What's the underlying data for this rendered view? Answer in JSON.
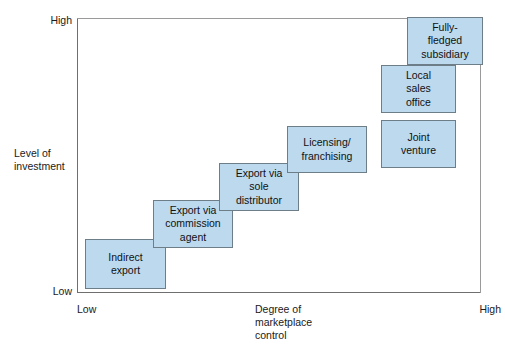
{
  "figure": {
    "width": 505,
    "height": 350,
    "background": "#ffffff",
    "box_fill": "#bcd9ee",
    "box_border": "#6e7e89",
    "axis_color": "#6f6f6f"
  },
  "axes": {
    "y": {
      "title": "Level of\ninvestment",
      "high_label": "High",
      "low_label": "Low"
    },
    "x": {
      "title": "Degree of\nmarketplace\ncontrol",
      "low_label": "Low",
      "high_label": "High"
    }
  },
  "chart_data": {
    "type": "diagram",
    "title": "",
    "xlabel": "Degree of marketplace control",
    "ylabel": "Level of investment",
    "xlim": [
      "Low",
      "High"
    ],
    "ylim": [
      "Low",
      "High"
    ],
    "grid": false,
    "legend": "none",
    "categories": [
      "Indirect export",
      "Export via commission agent",
      "Export via sole distributor",
      "Licensing/franchising",
      "Joint venture",
      "Local sales office",
      "Fully-fledged subsidiary"
    ],
    "steps": [
      {
        "label": "Indirect\nexport",
        "order": 1,
        "control": "lowest",
        "investment": "lowest",
        "x": 85,
        "y": 239,
        "w": 81,
        "h": 50
      },
      {
        "label": "Export via\ncommission\nagent",
        "order": 2,
        "control": "low",
        "investment": "low",
        "x": 153,
        "y": 200,
        "w": 80,
        "h": 48
      },
      {
        "label": "Export via\nsole\ndistributor",
        "order": 3,
        "control": "low-medium",
        "investment": "low-medium",
        "x": 219,
        "y": 163,
        "w": 80,
        "h": 48
      },
      {
        "label": "Licensing/\nfranchising",
        "order": 4,
        "control": "medium",
        "investment": "medium",
        "x": 287,
        "y": 126,
        "w": 80,
        "h": 47
      },
      {
        "label": "Joint\nventure",
        "order": 5,
        "control": "high",
        "investment": "medium-high",
        "x": 381,
        "y": 120,
        "w": 75,
        "h": 48
      },
      {
        "label": "Local\nsales\noffice",
        "order": 6,
        "control": "high",
        "investment": "high",
        "x": 381,
        "y": 65,
        "w": 75,
        "h": 48
      },
      {
        "label": "Fully-\nfledged\nsubsidiary",
        "order": 7,
        "control": "highest",
        "investment": "highest",
        "x": 407,
        "y": 17,
        "w": 76,
        "h": 48
      }
    ]
  }
}
